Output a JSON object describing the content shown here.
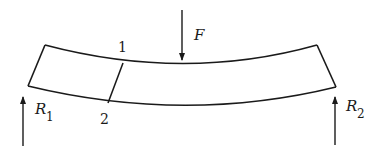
{
  "diagram": {
    "type": "bent-beam-free-body",
    "colors": {
      "stroke": "#1a1a1a",
      "background": "#ffffff"
    },
    "labels": {
      "force": "F",
      "reaction_left_main": "R",
      "reaction_left_sub": "1",
      "reaction_right_main": "R",
      "reaction_right_sub": "2",
      "section_top": "1",
      "section_bottom": "2"
    }
  }
}
